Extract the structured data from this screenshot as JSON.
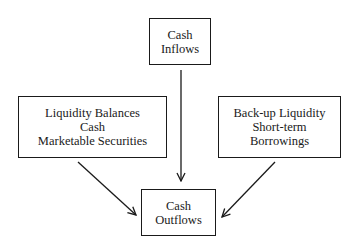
{
  "diagram": {
    "nodes": {
      "inflows": {
        "lines": [
          "Cash",
          "Inflows"
        ]
      },
      "liquidity": {
        "lines": [
          "Liquidity Balances",
          "Cash",
          "Marketable Securities"
        ]
      },
      "backup": {
        "lines": [
          "Back-up Liquidity",
          "Short-term",
          "Borrowings"
        ]
      },
      "outflows": {
        "lines": [
          "Cash",
          "Outflows"
        ]
      }
    },
    "edges": [
      {
        "from": "inflows",
        "to": "outflows"
      },
      {
        "from": "liquidity",
        "to": "outflows"
      },
      {
        "from": "backup",
        "to": "outflows"
      }
    ],
    "colors": {
      "stroke": "#1a1a1a",
      "background": "#ffffff"
    }
  }
}
